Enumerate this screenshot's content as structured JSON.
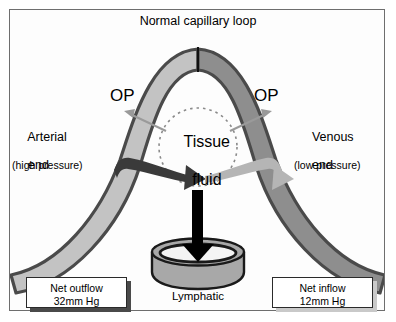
{
  "figure": {
    "title": "Normal capillary loop",
    "width": 396,
    "height": 322
  },
  "labels": {
    "arterial_end_line1": "Arterial",
    "arterial_end_line2": "end",
    "arterial_pressure": "(high pressure)",
    "venous_end_line1": "Venous",
    "venous_end_line2": "end",
    "venous_pressure": "(low pressure)",
    "op_left": "OP",
    "op_right": "OP",
    "tissue_fluid_line1": "Tissue",
    "tissue_fluid_line2": "fluid",
    "lymphatic": "Lymphatic"
  },
  "boxes": {
    "net_outflow_line1": "Net outflow",
    "net_outflow_line2": "32mm Hg",
    "net_inflow_line1": "Net inflow",
    "net_inflow_line2": "12mm Hg"
  },
  "colors": {
    "frame_border": "#6e6e6e",
    "background": "#ffffff",
    "arterial_limb_fill": "#c3c3c3",
    "venous_limb_fill": "#8e8e8e",
    "vessel_outline": "#4a4a4a",
    "outflow_arrow": "#3a3a3a",
    "inflow_arrow": "#b5b5b5",
    "lymph_arrow": "#000000",
    "op_arrow": "#9a9a9a",
    "tissue_circle_dash": "#8a8a8a",
    "lymphatic_body": "#a8a8a8",
    "lymphatic_lumen": "#f2f2f2"
  },
  "icons": {
    "outflow_arrow": "curved-arrow-right",
    "inflow_arrow": "curved-arrow-right",
    "lymph_arrow": "arrow-down",
    "op_left_arrow": "arrow-up-left",
    "op_right_arrow": "arrow-up-right"
  }
}
